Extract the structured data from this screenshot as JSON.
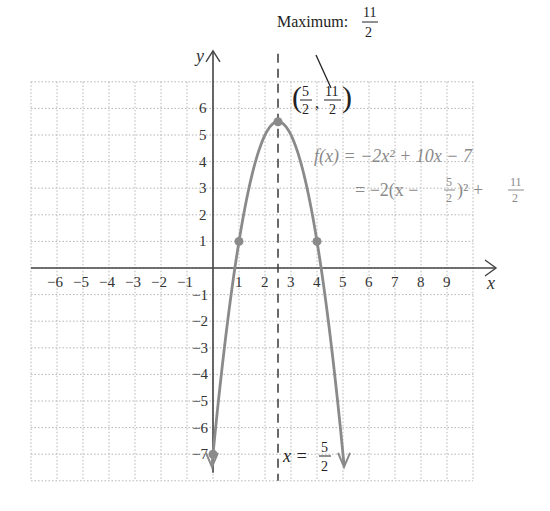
{
  "chart_data": {
    "type": "line",
    "title": "",
    "xlabel": "x",
    "ylabel": "y",
    "xlim": [
      -7,
      10
    ],
    "ylim": [
      -8,
      7
    ],
    "grid": true,
    "x_ticks": [
      "-6",
      "-5",
      "-4",
      "-3",
      "-2",
      "-1",
      "1",
      "2",
      "3",
      "4",
      "5",
      "6",
      "7",
      "8",
      "9"
    ],
    "y_ticks": [
      "6",
      "5",
      "4",
      "3",
      "2",
      "1",
      "-1",
      "-2",
      "-3",
      "-4",
      "-5",
      "-6",
      "-7"
    ],
    "series": [
      {
        "name": "f(x) = -2x^2 + 10x - 7",
        "function": "-2x^2 + 10x - 7",
        "x": [
          0,
          1,
          2.5,
          4,
          5
        ],
        "y": [
          -7,
          1,
          5.5,
          1,
          -7
        ],
        "color": "#8a8a8a"
      }
    ],
    "marked_points": [
      {
        "x": 0,
        "y": -7
      },
      {
        "x": 1,
        "y": 1
      },
      {
        "x": 2.5,
        "y": 5.5
      },
      {
        "x": 4,
        "y": 1
      }
    ],
    "axis_of_symmetry": {
      "x": 2.5,
      "label": "x = 5/2",
      "style": "dashed"
    },
    "annotations": [
      {
        "text": "Maximum: 11/2"
      },
      {
        "text": "(5/2, 11/2)"
      },
      {
        "text": "f(x) = -2x^2 + 10x - 7"
      },
      {
        "text": "= -2(x - 5/2)^2 + 11/2"
      }
    ]
  },
  "labels": {
    "y_axis": "y",
    "x_axis": "x",
    "maximum_prefix": "Maximum:",
    "max_num": "11",
    "max_den": "2",
    "vertex_x_num": "5",
    "vertex_x_den": "2",
    "vertex_y_num": "11",
    "vertex_y_den": "2",
    "formula_line1": "f(x) = −2x² + 10x − 7",
    "formula_line2_a": "= −2(x − ",
    "formula_line2_b": ")² + ",
    "f2_num1": "5",
    "f2_den1": "2",
    "f2_num2": "11",
    "f2_den2": "2",
    "sym_prefix": "x = ",
    "sym_num": "5",
    "sym_den": "2"
  }
}
